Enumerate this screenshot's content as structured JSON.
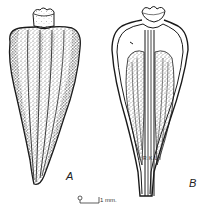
{
  "figure": {
    "panels": [
      {
        "id": "A",
        "label": "A",
        "description": "external view, stippled"
      },
      {
        "id": "B",
        "label": "B",
        "description": "longitudinal section"
      }
    ],
    "signature": "R.K.L.",
    "scale_bar": {
      "start": "0",
      "end_label": "1 mm."
    },
    "colors": {
      "ink": "#1a1a1a",
      "stipple": "#555555",
      "background": "#ffffff"
    }
  }
}
